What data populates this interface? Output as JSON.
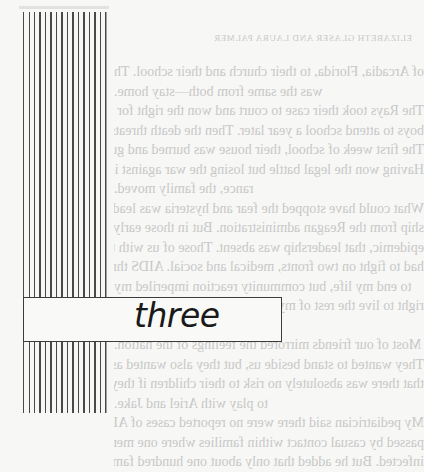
{
  "page": {
    "running_head": "ELIZABETH GLASER AND LAURA PALMER",
    "page_number": "46",
    "chapter_title": "three",
    "body_lines": [
      "of Arcadia, Florida, to their church and their school. The message",
      "was the same from both—stay home.",
      "The Rays took their case to court and won the right for the",
      "boys to attend school a year later. Then the death threats started.",
      "The first week of school, their house was burned and gutted.",
      "Having won the legal battle but losing the war against igno-",
      "rance, the family moved.",
      "What could have stopped the fear and hysteria was leader-",
      "ship from the Reagan administration. But in those early days of the",
      "epidemic, that leadership was absent. Those of us with the virus",
      "had to fight on two fronts, medical and social. AIDS threatened",
      "to end my life, but community reaction imperiled my",
      "right to live the rest of my life the way I chose. That was my",
      "fight.",
      "Most of our friends mirrored the feelings of the nation.",
      "They wanted to stand beside us, but they also wanted assurance",
      "that there was absolutely no risk to their children if they were",
      "to play with Ariel and Jake.",
      "My pediatrician said there were no reported cases of AIDS",
      "passed by casual contact within families where one member was",
      "infected. But he added that only about one hundred families had"
    ]
  }
}
